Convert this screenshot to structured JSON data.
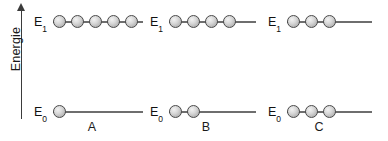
{
  "diagram": {
    "axis": {
      "label": "Energie",
      "arrow_icon": "arrow-up-icon",
      "direction": "up"
    },
    "level_labels": {
      "excited": "E",
      "excited_sub": "1",
      "ground": "E",
      "ground_sub": "0"
    },
    "groups": [
      {
        "name": "A",
        "levels": [
          {
            "id": "E1",
            "label": "E",
            "sublabel": "1",
            "particles": 5
          },
          {
            "id": "E0",
            "label": "E",
            "sublabel": "0",
            "particles": 1
          }
        ]
      },
      {
        "name": "B",
        "levels": [
          {
            "id": "E1",
            "label": "E",
            "sublabel": "1",
            "particles": 4
          },
          {
            "id": "E0",
            "label": "E",
            "sublabel": "0",
            "particles": 2
          }
        ]
      },
      {
        "name": "C",
        "levels": [
          {
            "id": "E1",
            "label": "E",
            "sublabel": "1",
            "particles": 3
          },
          {
            "id": "E0",
            "label": "E",
            "sublabel": "0",
            "particles": 3
          }
        ]
      }
    ]
  },
  "chart_data": {
    "type": "diagram",
    "ylabel": "Energie",
    "categories": [
      "A",
      "B",
      "C"
    ],
    "levels": [
      "E1",
      "E0"
    ],
    "series": [
      {
        "name": "E1",
        "values": [
          1,
          2,
          3
        ]
      },
      {
        "name": "E0",
        "values": [
          5,
          4,
          3
        ]
      }
    ],
    "grid": false,
    "legend": "none",
    "annotations": [
      "A",
      "B",
      "C"
    ]
  },
  "colors": {
    "axis": "#3b3b3b",
    "rail": "#6e6e6e",
    "ball_outline": "#4a4a4a",
    "ball_fill": "#d9d9d9",
    "text": "#1a1a1a",
    "background": "#ffffff"
  }
}
